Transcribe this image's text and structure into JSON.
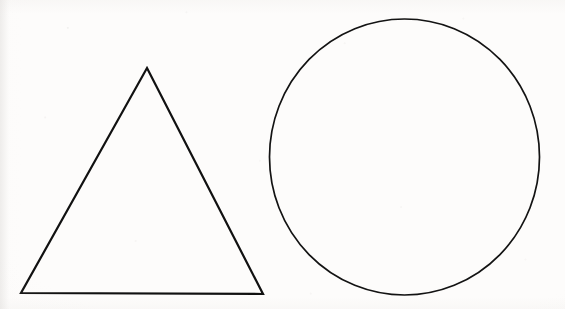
{
  "image": {
    "title": "Scanned line drawing: triangle and circle",
    "width": 565,
    "height": 309,
    "background_color": "#fdfcfb",
    "stroke_color": "#121212",
    "medium": "scanned paper line drawing",
    "shape_count": "2"
  },
  "shapes": [
    {
      "name": "triangle",
      "label": "Triangle",
      "kind": "polygon",
      "sides": 3,
      "fill": "none",
      "stroke_color": "#111111",
      "stroke_width": 2.2,
      "points": "147,68 263,294 21,293",
      "vertices": [
        {
          "label": "apex",
          "x": 147,
          "y": 68
        },
        {
          "label": "bottom-right",
          "x": 263,
          "y": 294
        },
        {
          "label": "bottom-left",
          "x": 21,
          "y": 293
        }
      ],
      "bbox": {
        "x": 21,
        "y": 68,
        "width": 242,
        "height": 226
      },
      "base_length": 242,
      "height_px": 226
    },
    {
      "name": "circle",
      "label": "Circle",
      "kind": "ellipse",
      "fill": "none",
      "stroke_color": "#131313",
      "stroke_width": 1.7,
      "center": {
        "x": 404.5,
        "y": 157
      },
      "radius_x": 135,
      "radius_y": 138,
      "bbox": {
        "x": 269,
        "y": 19,
        "width": 271,
        "height": 276
      },
      "diameter_x": 271,
      "diameter_y": 276
    }
  ]
}
